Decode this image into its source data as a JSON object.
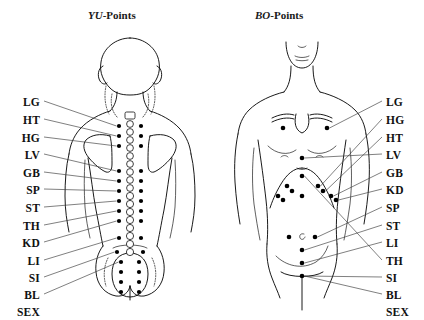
{
  "figure": {
    "width": 424,
    "height": 320,
    "background": "#ffffff",
    "ink": "#000000"
  },
  "panels": [
    {
      "id": "yu",
      "title_emphasis": "YU",
      "title_rest": "-Points",
      "view": "posterior-back-view",
      "label_side": "left"
    },
    {
      "id": "bo",
      "title_emphasis": "BO",
      "title_rest": "-Points",
      "view": "anterior-front-view",
      "label_side": "right"
    }
  ],
  "left_labels": [
    {
      "text": "LG",
      "x": 40,
      "y": 104,
      "leader": true
    },
    {
      "text": "HT",
      "x": 40,
      "y": 122,
      "leader": true
    },
    {
      "text": "HG",
      "x": 40,
      "y": 140,
      "leader": true
    },
    {
      "text": "LV",
      "x": 40,
      "y": 157,
      "leader": true
    },
    {
      "text": "GB",
      "x": 40,
      "y": 175,
      "leader": true
    },
    {
      "text": "SP",
      "x": 40,
      "y": 192,
      "leader": true
    },
    {
      "text": "ST",
      "x": 40,
      "y": 210,
      "leader": true
    },
    {
      "text": "TH",
      "x": 40,
      "y": 228,
      "leader": true
    },
    {
      "text": "KD",
      "x": 40,
      "y": 245,
      "leader": true
    },
    {
      "text": "LI",
      "x": 40,
      "y": 263,
      "leader": true
    },
    {
      "text": "SI",
      "x": 40,
      "y": 280,
      "leader": true
    },
    {
      "text": "BL",
      "x": 40,
      "y": 297,
      "leader": true
    },
    {
      "text": "SEX",
      "x": 40,
      "y": 314,
      "leader": false
    }
  ],
  "right_labels": [
    {
      "text": "LG",
      "x": 386,
      "y": 104,
      "leader": true
    },
    {
      "text": "HG",
      "x": 386,
      "y": 122,
      "leader": true
    },
    {
      "text": "HT",
      "x": 386,
      "y": 140,
      "leader": true
    },
    {
      "text": "LV",
      "x": 386,
      "y": 157,
      "leader": true
    },
    {
      "text": "GB",
      "x": 386,
      "y": 175,
      "leader": true
    },
    {
      "text": "KD",
      "x": 386,
      "y": 192,
      "leader": true
    },
    {
      "text": "SP",
      "x": 386,
      "y": 210,
      "leader": true
    },
    {
      "text": "ST",
      "x": 386,
      "y": 228,
      "leader": true
    },
    {
      "text": "LI",
      "x": 386,
      "y": 245,
      "leader": true
    },
    {
      "text": "TH",
      "x": 386,
      "y": 263,
      "leader": true
    },
    {
      "text": "SI",
      "x": 386,
      "y": 280,
      "leader": true
    },
    {
      "text": "BL",
      "x": 386,
      "y": 297,
      "leader": true
    },
    {
      "text": "SEX",
      "x": 386,
      "y": 314,
      "leader": false
    }
  ],
  "yu_points": {
    "description": "paired bladder-meridian shu points flanking the spine, plus sacral cluster",
    "spine_x": 130,
    "paired": [
      {
        "y": 126,
        "dx": 11
      },
      {
        "y": 136,
        "dx": 11
      },
      {
        "y": 146,
        "dx": 11
      },
      {
        "y": 171,
        "dx": 11
      },
      {
        "y": 181,
        "dx": 11
      },
      {
        "y": 191,
        "dx": 11
      },
      {
        "y": 201,
        "dx": 11
      },
      {
        "y": 211,
        "dx": 11
      },
      {
        "y": 221,
        "dx": 11
      },
      {
        "y": 238,
        "dx": 11
      },
      {
        "y": 252,
        "dx": 13
      }
    ],
    "sacral_rows": [
      {
        "y": 262,
        "dx": 9
      },
      {
        "y": 272,
        "dx": 9
      },
      {
        "y": 282,
        "dx": 9
      },
      {
        "y": 292,
        "dx": 9
      }
    ]
  },
  "bo_points": {
    "description": "anterior alarm points on chest and abdomen",
    "midline_x": 302,
    "points": [
      {
        "x": 283,
        "y": 128
      },
      {
        "x": 327,
        "y": 128
      },
      {
        "x": 302,
        "y": 158
      },
      {
        "x": 302,
        "y": 176
      },
      {
        "x": 287,
        "y": 186
      },
      {
        "x": 318,
        "y": 186
      },
      {
        "x": 292,
        "y": 191
      },
      {
        "x": 323,
        "y": 191
      },
      {
        "x": 278,
        "y": 196
      },
      {
        "x": 331,
        "y": 196
      },
      {
        "x": 283,
        "y": 200
      },
      {
        "x": 336,
        "y": 200
      },
      {
        "x": 302,
        "y": 196
      },
      {
        "x": 289,
        "y": 237
      },
      {
        "x": 315,
        "y": 237
      },
      {
        "x": 302,
        "y": 250
      },
      {
        "x": 302,
        "y": 263
      },
      {
        "x": 302,
        "y": 276
      }
    ],
    "navel": {
      "x": 302,
      "y": 236
    }
  }
}
